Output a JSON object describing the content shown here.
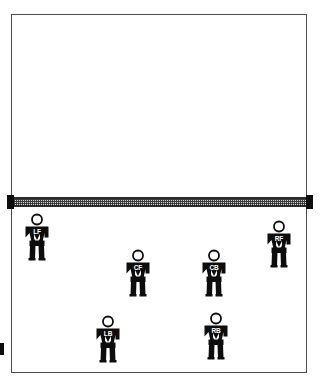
{
  "diagram": {
    "court": {
      "boundary_color": "#4c4c4c",
      "surface_color": "#ffffff"
    },
    "net": {
      "label": "net",
      "mesh_color": "#d8d8d8",
      "tape_color": "#2b2b2b",
      "post_color": "#0d0d0d",
      "left_post_label": "net-post-left",
      "right_post_label": "net-post-right"
    },
    "markers": {
      "left_edge_marker_label": "sideline-marker"
    },
    "players": [
      {
        "id": "left-forward",
        "label": "LF",
        "name": "Left Forward",
        "x": 20,
        "y": 213
      },
      {
        "id": "right-forward",
        "label": "RF",
        "name": "Right Forward",
        "x": 262,
        "y": 220
      },
      {
        "id": "center-forward",
        "label": "CF",
        "name": "Center Forward",
        "x": 121,
        "y": 249
      },
      {
        "id": "center-back",
        "label": "CB",
        "name": "Center Back",
        "x": 197,
        "y": 249
      },
      {
        "id": "left-back",
        "label": "LB",
        "name": "Left Back",
        "x": 91,
        "y": 315
      },
      {
        "id": "right-back",
        "label": "RB",
        "name": "Right Back",
        "x": 199,
        "y": 312
      }
    ]
  }
}
